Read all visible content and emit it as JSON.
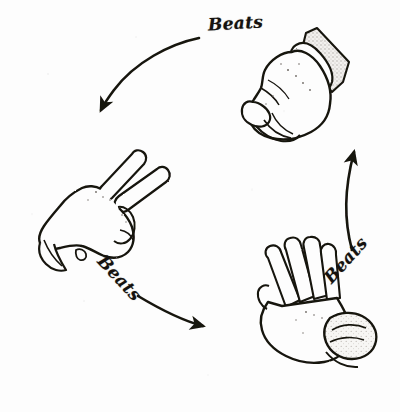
{
  "figure": {
    "background_color": "#fdfdfd",
    "ink_color": "#1a1714",
    "shade_color": "#c9c6c2"
  },
  "labels": {
    "top": "Beats",
    "bottom_left": "Beats",
    "right": "Beats"
  },
  "hands": [
    {
      "id": "rock",
      "name": "closed-fist-rock-hand",
      "position": "top-right",
      "description": "Closed fist with shaded sleeve cuff, knuckles facing lower-left"
    },
    {
      "id": "scissors",
      "name": "two-finger-scissors-hand",
      "position": "left",
      "description": "Hand with index and middle fingers extended upward-right"
    },
    {
      "id": "paper",
      "name": "flat-open-paper-hand",
      "position": "bottom-right",
      "description": "Flat open hand, fingers together pointing upper-left, shaded cuff at wrist"
    }
  ],
  "arrows": [
    {
      "id": "rock-to-scissors",
      "name": "arrow-rock-beats-scissors",
      "from": "rock",
      "to": "scissors",
      "label": "Beats",
      "direction": "down-left"
    },
    {
      "id": "scissors-to-paper",
      "name": "arrow-scissors-beats-paper",
      "from": "scissors",
      "to": "paper",
      "label": "Beats",
      "direction": "down-right"
    },
    {
      "id": "paper-to-rock",
      "name": "arrow-paper-beats-rock",
      "from": "paper",
      "to": "rock",
      "label": "Beats",
      "direction": "up"
    }
  ]
}
